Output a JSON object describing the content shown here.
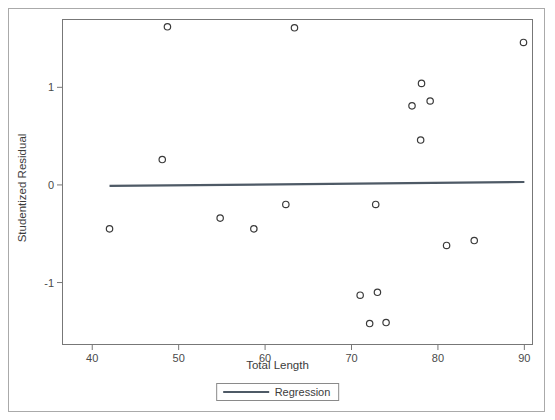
{
  "chart_data": {
    "type": "scatter",
    "title": "",
    "xlabel": "Total Length",
    "ylabel": "Studentized Residual",
    "xlim": [
      36.5,
      91.0
    ],
    "ylim": [
      -1.64,
      1.7
    ],
    "xticks": [
      40,
      50,
      60,
      70,
      80,
      90
    ],
    "xtick_labels": [
      "40",
      "50",
      "60",
      "70",
      "80",
      "90"
    ],
    "yticks": [
      1,
      0,
      -1
    ],
    "ytick_labels": [
      "1",
      "0",
      "-1"
    ],
    "grid": false,
    "legend_position": "below-axis-center",
    "series": [
      {
        "name": "Observations",
        "type": "scatter",
        "marker": "open-circle",
        "color": "#3a3a3a",
        "points": [
          {
            "x": 42.0,
            "y": -0.45
          },
          {
            "x": 48.1,
            "y": 0.26
          },
          {
            "x": 48.7,
            "y": 1.62
          },
          {
            "x": 54.8,
            "y": -0.34
          },
          {
            "x": 58.7,
            "y": -0.45
          },
          {
            "x": 62.4,
            "y": -0.2
          },
          {
            "x": 63.4,
            "y": 1.61
          },
          {
            "x": 71.0,
            "y": -1.13
          },
          {
            "x": 72.1,
            "y": -1.42
          },
          {
            "x": 72.8,
            "y": -0.2
          },
          {
            "x": 73.0,
            "y": -1.1
          },
          {
            "x": 74.0,
            "y": -1.41
          },
          {
            "x": 77.0,
            "y": 0.81
          },
          {
            "x": 78.0,
            "y": 0.46
          },
          {
            "x": 78.1,
            "y": 1.04
          },
          {
            "x": 79.1,
            "y": 0.86
          },
          {
            "x": 81.0,
            "y": -0.62
          },
          {
            "x": 84.2,
            "y": -0.57
          },
          {
            "x": 89.9,
            "y": 1.46
          }
        ]
      },
      {
        "name": "Regression",
        "type": "line",
        "color": "#4e5a66",
        "points": [
          {
            "x": 42.0,
            "y": -0.01
          },
          {
            "x": 90.0,
            "y": 0.03
          }
        ]
      }
    ],
    "legend": [
      {
        "label": "Regression",
        "color": "#4e5a66",
        "marker": "line"
      }
    ]
  },
  "axes": {
    "x_title": "Total Length",
    "y_title": "Studentized Residual"
  },
  "legend": {
    "regression_label": "Regression"
  },
  "colors": {
    "frame": "#777777",
    "outer_frame": "#aaaaaa",
    "marker": "#3a3a3a",
    "regression_line": "#4e5a66",
    "text": "#3c3c3c",
    "background": "#ffffff"
  }
}
